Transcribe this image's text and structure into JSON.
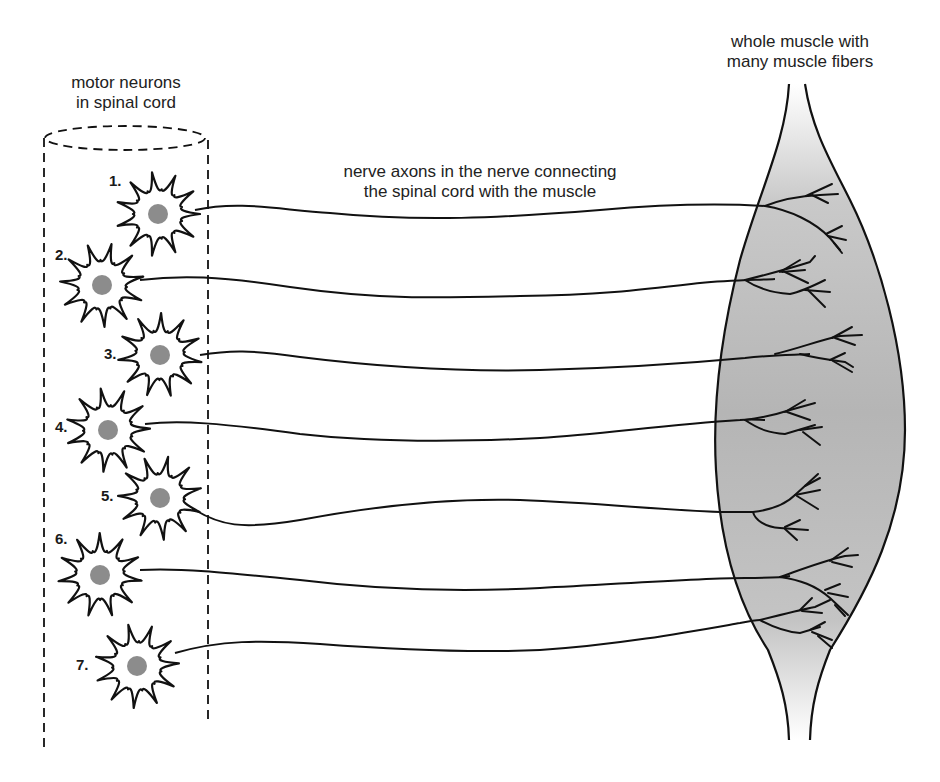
{
  "labels": {
    "spinal_cord": [
      "motor neurons",
      "in spinal cord"
    ],
    "axons": [
      "nerve axons in the nerve connecting",
      "the spinal cord with the muscle"
    ],
    "muscle": [
      "whole muscle with",
      "many muscle fibers"
    ]
  },
  "neurons": [
    {
      "number": "1.",
      "cx": 158,
      "cy": 214
    },
    {
      "number": "2.",
      "cx": 102,
      "cy": 285
    },
    {
      "number": "3.",
      "cx": 160,
      "cy": 355
    },
    {
      "number": "4.",
      "cx": 108,
      "cy": 430
    },
    {
      "number": "5.",
      "cx": 160,
      "cy": 498
    },
    {
      "number": "6.",
      "cx": 100,
      "cy": 575
    },
    {
      "number": "7.",
      "cx": 137,
      "cy": 666
    }
  ],
  "colors": {
    "line": "#111111",
    "nucleus": "#8c8c8c",
    "muscle_fill": "#b8b8b8",
    "text": "#222222"
  }
}
